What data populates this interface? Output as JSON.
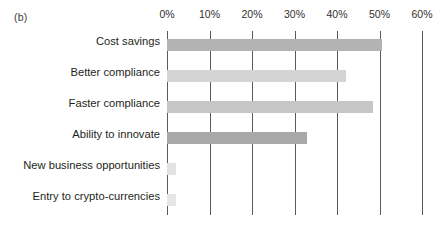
{
  "figure": {
    "panel_label": "(b)",
    "background": "#ffffff"
  },
  "chart_data": {
    "type": "bar",
    "orientation": "horizontal",
    "title": "",
    "xlabel": "",
    "ylabel": "",
    "categories": [
      "Cost savings",
      "Better compliance",
      "Faster compliance",
      "Ability to innovate",
      "New business opportunities",
      "Entry to crypto-currencies"
    ],
    "values": [
      50.5,
      42.0,
      48.5,
      33.0,
      2.0,
      2.0
    ],
    "value_unit": "%",
    "xlim": [
      0,
      60
    ],
    "xticks": [
      0,
      10,
      20,
      30,
      40,
      50,
      60
    ],
    "xtick_labels": [
      "0%",
      "10%",
      "20%",
      "30%",
      "40%",
      "50%",
      "60%"
    ],
    "grid": "vertical",
    "legend": "none",
    "bar_colors": [
      "#b3b3b3",
      "#d4d4d4",
      "#c6c6c6",
      "#a8a8a8",
      "#e2e2e2",
      "#e6e6e6"
    ],
    "gridline_color": "#5b5b5b",
    "text_color": "#231f20"
  }
}
